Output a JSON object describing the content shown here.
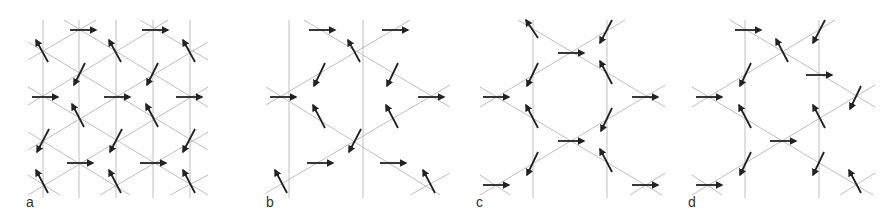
{
  "figure": {
    "panels": [
      {
        "id": "a",
        "label": "a",
        "description": "kagome lattice spin configuration (q=0 / uniform)"
      },
      {
        "id": "b",
        "label": "b",
        "description": "kagome lattice spin configuration with hexagon"
      },
      {
        "id": "c",
        "label": "c",
        "description": "kagome lattice spin configuration with hexagon"
      },
      {
        "id": "d",
        "label": "d",
        "description": "kagome lattice spin configuration with hexagon"
      }
    ],
    "colors": {
      "lattice_line": "#b0b0b0",
      "arrow": "#222222",
      "label": "#333333"
    }
  }
}
